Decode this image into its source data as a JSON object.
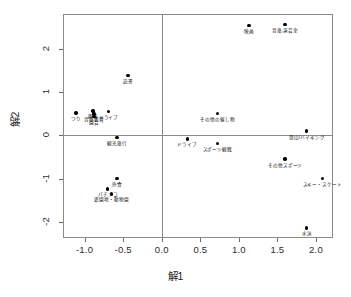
{
  "chart_data": {
    "type": "scatter",
    "title": "",
    "xlabel": "解1",
    "ylabel": "解2",
    "xlim": [
      -1.28,
      2.22
    ],
    "ylim": [
      -2.38,
      2.82
    ],
    "grid": false,
    "legend": "none",
    "xticks": [
      "-1.0",
      "-0.5",
      "0.0",
      "0.5",
      "1.0",
      "1.5",
      "2.0"
    ],
    "xtick_values": [
      -1.0,
      -0.5,
      0.0,
      0.5,
      1.0,
      1.5,
      2.0
    ],
    "yticks": [
      "2",
      "1",
      "0",
      "-1",
      "-2"
    ],
    "ytick_values": [
      2,
      1,
      0,
      -1,
      -2
    ],
    "reference_lines": {
      "x": 0.0,
      "y": 0.0
    },
    "points": [
      {
        "label": "映画",
        "x": 1.13,
        "y": 2.55,
        "label_pos": "below"
      },
      {
        "label": "音楽,演芸全",
        "x": 1.6,
        "y": 2.58,
        "label_pos": "below"
      },
      {
        "label": "読書",
        "x": -0.44,
        "y": 1.39,
        "label_pos": "below"
      },
      {
        "label": "つり",
        "x": -1.11,
        "y": 0.52,
        "label_pos": "below"
      },
      {
        "label": "趣味",
        "x": -0.89,
        "y": 0.57,
        "label_pos": "below"
      },
      {
        "label": "音楽鑑賞",
        "x": -0.88,
        "y": 0.5,
        "label_pos": "below"
      },
      {
        "label": "園芸",
        "x": -0.88,
        "y": 0.44,
        "label_pos": "below"
      },
      {
        "label": "ドライブ",
        "x": -0.69,
        "y": 0.56,
        "label_pos": "below"
      },
      {
        "label": "その他の催し物",
        "x": 0.72,
        "y": 0.51,
        "label_pos": "below"
      },
      {
        "label": "登山/ハイキング",
        "x": 1.88,
        "y": 0.1,
        "label_pos": "below"
      },
      {
        "label": "観光旅行",
        "x": -0.58,
        "y": -0.04,
        "label_pos": "below"
      },
      {
        "label": "ドライブ",
        "x": 0.33,
        "y": -0.08,
        "label_pos": "below"
      },
      {
        "label": "スポーツ観戦",
        "x": 0.72,
        "y": -0.19,
        "label_pos": "below"
      },
      {
        "label": "その他スポーツ",
        "x": 1.6,
        "y": -0.55,
        "label_pos": "below"
      },
      {
        "label": "スキー・スケート",
        "x": 2.08,
        "y": -1.0,
        "label_pos": "below"
      },
      {
        "label": "外食",
        "x": -0.58,
        "y": -1.0,
        "label_pos": "below"
      },
      {
        "label": "パチンコ",
        "x": -0.7,
        "y": -1.24,
        "label_pos": "below"
      },
      {
        "label": "遊園地・動物園",
        "x": -0.65,
        "y": -1.36,
        "label_pos": "below"
      },
      {
        "label": "水泳",
        "x": 1.88,
        "y": -2.15,
        "label_pos": "below"
      }
    ]
  }
}
